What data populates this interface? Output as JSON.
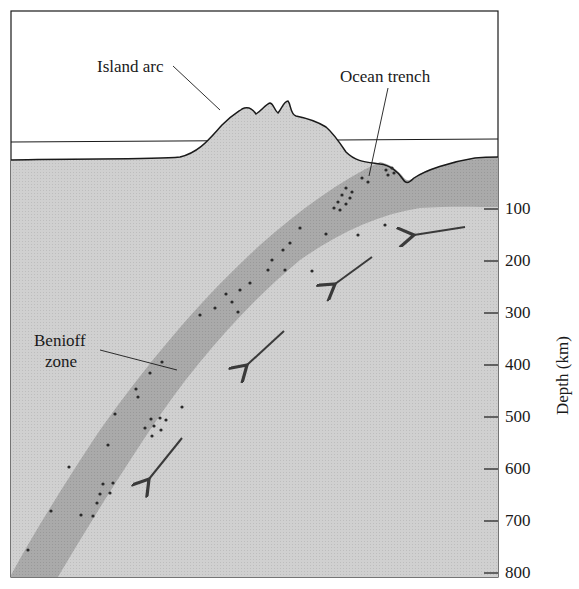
{
  "diagram": {
    "type": "cross-section",
    "labels": {
      "island_arc": "Island arc",
      "ocean_trench": "Ocean trench",
      "benioff_zone_line1": "Benioff",
      "benioff_zone_line2": "zone"
    },
    "axis": {
      "title": "Depth (km)",
      "ticks": [
        "100",
        "200",
        "300",
        "400",
        "500",
        "600",
        "700",
        "800"
      ]
    },
    "colors": {
      "background": "#ffffff",
      "mantle": "#cfcfcf",
      "slab": "#a9a9a9",
      "outline": "#1a1a1a",
      "earthquake_dots": "#2a2a2a",
      "arrows": "#3a3a3a"
    },
    "arrows_count": 4,
    "arrow_meaning": "slab descending direction"
  }
}
